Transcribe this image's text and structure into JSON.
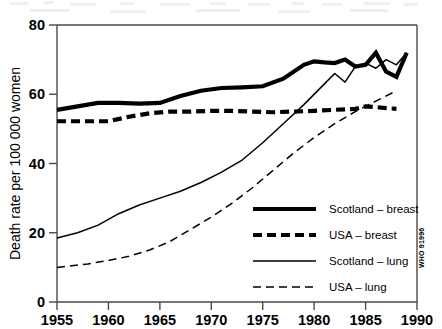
{
  "credit": "WHO 91996",
  "chart_data": {
    "type": "line",
    "title": "",
    "xlabel": "",
    "ylabel": "Death rate per 100 000 women",
    "xlim": [
      1955,
      1990
    ],
    "ylim": [
      0,
      80
    ],
    "xticks": [
      1955,
      1960,
      1965,
      1970,
      1975,
      1980,
      1985,
      1990
    ],
    "xtick_labels": [
      "1955",
      "1960",
      "1965",
      "1970",
      "1975",
      "1980",
      "1985",
      "1990"
    ],
    "yticks": [
      0,
      20,
      40,
      60,
      80
    ],
    "ytick_labels": [
      "0",
      "20",
      "40",
      "60",
      "80"
    ],
    "grid": false,
    "legend_position": "inside lower right",
    "series": [
      {
        "name": "Scotland – breast",
        "style": "thick-solid",
        "color": "#000000",
        "x": [
          1955,
          1957,
          1959,
          1961,
          1963,
          1965,
          1967,
          1969,
          1971,
          1973,
          1975,
          1977,
          1979,
          1980,
          1981,
          1982,
          1983,
          1984,
          1985,
          1986,
          1987,
          1988,
          1989
        ],
        "values": [
          55.5,
          56.5,
          57.5,
          57.5,
          57.3,
          57.5,
          59.5,
          61.0,
          61.8,
          62.0,
          62.3,
          64.5,
          68.5,
          69.5,
          69.2,
          69.0,
          70.0,
          68.0,
          68.5,
          72.0,
          66.5,
          65.0,
          72.0
        ]
      },
      {
        "name": "USA – breast",
        "style": "thick-dashed",
        "color": "#000000",
        "x": [
          1955,
          1958,
          1960,
          1962,
          1964,
          1966,
          1968,
          1970,
          1972,
          1974,
          1976,
          1978,
          1980,
          1982,
          1984,
          1985,
          1986,
          1987,
          1988
        ],
        "values": [
          52.2,
          52.2,
          52.2,
          53.5,
          54.5,
          55.0,
          55.0,
          55.2,
          55.2,
          55.0,
          54.8,
          55.0,
          55.2,
          55.5,
          55.8,
          56.5,
          56.3,
          56.0,
          55.8
        ]
      },
      {
        "name": "Scotland – lung",
        "style": "thin-solid",
        "color": "#000000",
        "x": [
          1955,
          1957,
          1959,
          1961,
          1963,
          1965,
          1967,
          1969,
          1971,
          1973,
          1975,
          1977,
          1979,
          1981,
          1982,
          1983,
          1984,
          1985,
          1986,
          1987,
          1988,
          1989
        ],
        "values": [
          18.5,
          20.0,
          22.2,
          25.5,
          28.0,
          30.0,
          32.0,
          34.5,
          37.5,
          41.0,
          46.0,
          51.5,
          57.0,
          63.0,
          66.0,
          63.5,
          68.0,
          69.0,
          67.5,
          70.0,
          68.5,
          72.0
        ]
      },
      {
        "name": "USA – lung",
        "style": "thin-dashed",
        "color": "#000000",
        "x": [
          1955,
          1958,
          1960,
          1962,
          1964,
          1966,
          1968,
          1970,
          1972,
          1974,
          1976,
          1978,
          1980,
          1982,
          1984,
          1986,
          1988
        ],
        "values": [
          10.0,
          11.0,
          12.0,
          13.2,
          15.0,
          17.5,
          21.0,
          24.5,
          28.5,
          33.0,
          38.0,
          43.0,
          47.5,
          51.5,
          55.0,
          58.0,
          61.0
        ]
      }
    ]
  },
  "legend": {
    "items": [
      {
        "label": "Scotland – breast",
        "style": "thick-solid"
      },
      {
        "label": "USA – breast",
        "style": "thick-dashed"
      },
      {
        "label": "Scotland – lung",
        "style": "thin-solid"
      },
      {
        "label": "USA – lung",
        "style": "thin-dashed"
      }
    ]
  }
}
